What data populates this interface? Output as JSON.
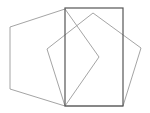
{
  "diagram": {
    "background": "#ffffff",
    "shapes": [
      {
        "name": "left-pentagon",
        "type": "polygon",
        "points": "65,9 10,27 10,89 65,106 99,57",
        "stroke": "#9a9a9a",
        "stroke_width": 0.9
      },
      {
        "name": "right-pentagon",
        "type": "polygon",
        "points": "93,13 141,48 123,106 65,106 47,49",
        "stroke": "#9a9a9a",
        "stroke_width": 0.9
      },
      {
        "name": "rectangle",
        "type": "rect",
        "x": 65,
        "y": 8,
        "width": 58,
        "height": 98,
        "stroke": "#555555",
        "stroke_width": 1.2
      }
    ]
  }
}
